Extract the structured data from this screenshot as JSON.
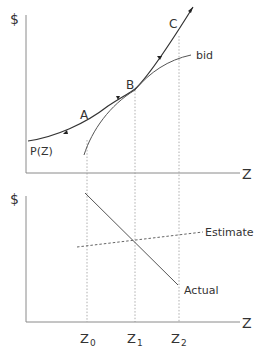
{
  "diagram": {
    "top_panel": {
      "y_axis_label": "$",
      "x_axis_label": "Z",
      "curves": [
        {
          "name": "P(Z)",
          "label": "P(Z)"
        },
        {
          "name": "bid",
          "label": "bid"
        }
      ],
      "points": [
        {
          "label": "A"
        },
        {
          "label": "B"
        },
        {
          "label": "C"
        }
      ]
    },
    "bottom_panel": {
      "y_axis_label": "$",
      "x_axis_label": "Z",
      "lines": [
        {
          "name": "Estimate",
          "label": "Estimate",
          "style": "dashed"
        },
        {
          "name": "Actual",
          "label": "Actual",
          "style": "solid"
        }
      ]
    },
    "x_ticks": [
      {
        "base": "Z",
        "sub": "0"
      },
      {
        "base": "Z",
        "sub": "1"
      },
      {
        "base": "Z",
        "sub": "2"
      }
    ],
    "colors": {
      "background": "#ffffff",
      "axis": "#8a8a8a",
      "curve": "#555555",
      "text": "#333333"
    }
  }
}
